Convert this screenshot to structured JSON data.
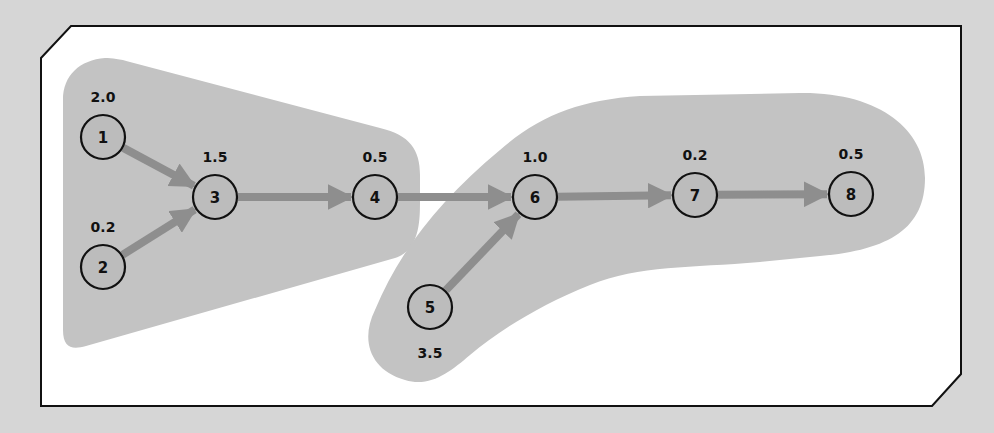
{
  "diagram": {
    "type": "directed-graph",
    "nodes": [
      {
        "id": "1",
        "label": "1",
        "weight": "2.0",
        "x": 103,
        "y": 137,
        "label_pos": "above"
      },
      {
        "id": "2",
        "label": "2",
        "weight": "0.2",
        "x": 103,
        "y": 267,
        "label_pos": "above"
      },
      {
        "id": "3",
        "label": "3",
        "weight": "1.5",
        "x": 215,
        "y": 197,
        "label_pos": "above"
      },
      {
        "id": "4",
        "label": "4",
        "weight": "0.5",
        "x": 375,
        "y": 197,
        "label_pos": "above"
      },
      {
        "id": "5",
        "label": "5",
        "weight": "3.5",
        "x": 430,
        "y": 307,
        "label_pos": "below"
      },
      {
        "id": "6",
        "label": "6",
        "weight": "1.0",
        "x": 535,
        "y": 197,
        "label_pos": "above"
      },
      {
        "id": "7",
        "label": "7",
        "weight": "0.2",
        "x": 695,
        "y": 195,
        "label_pos": "above"
      },
      {
        "id": "8",
        "label": "8",
        "weight": "0.5",
        "x": 851,
        "y": 194,
        "label_pos": "above"
      }
    ],
    "edges": [
      {
        "from": "1",
        "to": "3"
      },
      {
        "from": "2",
        "to": "3"
      },
      {
        "from": "3",
        "to": "4"
      },
      {
        "from": "4",
        "to": "6"
      },
      {
        "from": "5",
        "to": "6"
      },
      {
        "from": "6",
        "to": "7"
      },
      {
        "from": "7",
        "to": "8"
      }
    ],
    "groups": [
      {
        "name": "group-a",
        "members": [
          "1",
          "2",
          "3",
          "4"
        ]
      },
      {
        "name": "group-b",
        "members": [
          "5",
          "6",
          "7",
          "8"
        ]
      }
    ],
    "colors": {
      "background": "#d6d6d6",
      "frame_fill": "#ffffff",
      "frame_stroke": "#111111",
      "group_fill": "#c3c3c3",
      "node_fill": "#bcbcbc",
      "arrow": "#8e8e8e"
    }
  }
}
